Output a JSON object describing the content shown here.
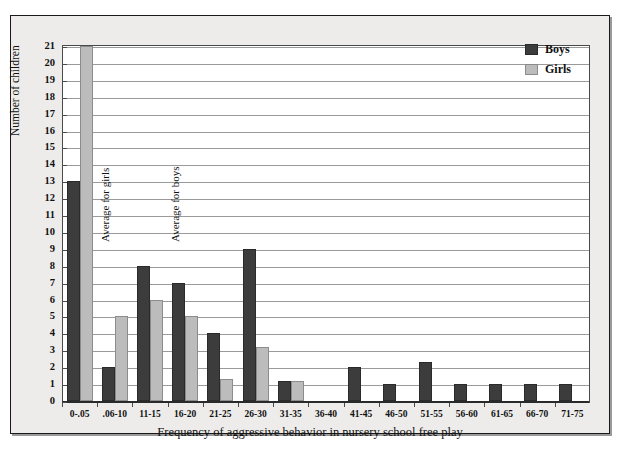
{
  "chart_data": {
    "type": "bar",
    "title": "",
    "xlabel": "Frequency of aggressive behavior in nursery school free play",
    "ylabel": "Number of children",
    "ylim": [
      0,
      21
    ],
    "ytick_step": 1,
    "grid": true,
    "legend_position": "top-right",
    "categories": [
      "0-.05",
      ".06-10",
      "11-15",
      "16-20",
      "21-25",
      "26-30",
      "31-35",
      "36-40",
      "41-45",
      "46-50",
      "51-55",
      "56-60",
      "61-65",
      "66-70",
      "71-75"
    ],
    "series": [
      {
        "name": "Boys",
        "color": "#3c3c3c",
        "values": [
          13,
          2,
          8,
          7,
          4,
          9,
          1.2,
          0,
          2,
          1,
          2.3,
          1,
          1,
          1,
          1
        ]
      },
      {
        "name": "Girls",
        "color": "#bcbcbc",
        "values": [
          21,
          5,
          6,
          5,
          1.3,
          3.2,
          1.2,
          0,
          0,
          0,
          0,
          0,
          0,
          0,
          0
        ]
      }
    ],
    "yticks": [
      "0",
      "1",
      "2",
      "3",
      "4",
      "5",
      "6",
      "7",
      "8",
      "9",
      "10",
      "11",
      "12",
      "13",
      "14",
      "15",
      "16",
      "17",
      "18",
      "19",
      "20",
      "21"
    ],
    "annotations": [
      {
        "text": "Average for girls",
        "orientation": "vertical",
        "category": ".06-10"
      },
      {
        "text": "Average for boys",
        "orientation": "vertical",
        "category": "16-20"
      }
    ]
  }
}
